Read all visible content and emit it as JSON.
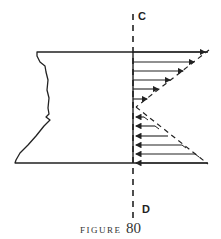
{
  "figure": {
    "axis_top_label": "C",
    "axis_bottom_label": "D",
    "caption_word": "FIGURE",
    "caption_number": "80"
  },
  "colors": {
    "ink": "#222222",
    "background": "#ffffff"
  }
}
